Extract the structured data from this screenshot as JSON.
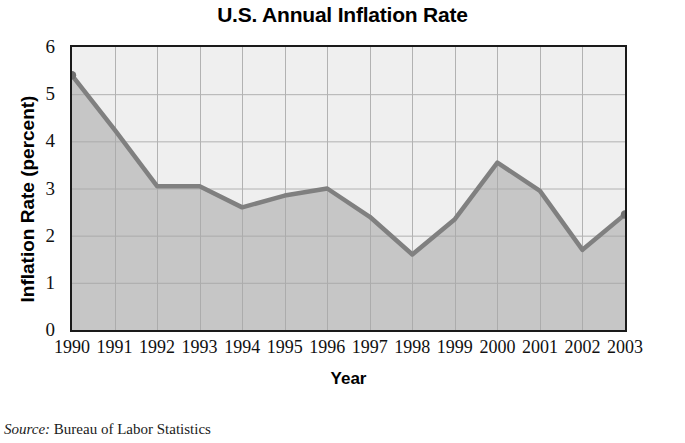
{
  "chart_data": {
    "type": "area",
    "title": "U.S. Annual Inflation Rate",
    "xlabel": "Year",
    "ylabel": "Inflation Rate (percent)",
    "categories": [
      "1990",
      "1991",
      "1992",
      "1993",
      "1994",
      "1995",
      "1996",
      "1997",
      "1998",
      "1999",
      "2000",
      "2001",
      "2002",
      "2003"
    ],
    "values": [
      5.4,
      4.25,
      3.05,
      3.05,
      2.6,
      2.85,
      3.0,
      2.4,
      1.6,
      2.35,
      3.55,
      2.95,
      1.7,
      2.45
    ],
    "series": [
      {
        "name": "U.S. Annual Inflation Rate",
        "values": [
          5.4,
          4.25,
          3.05,
          3.05,
          2.6,
          2.85,
          3.0,
          2.4,
          1.6,
          2.35,
          3.55,
          2.95,
          1.7,
          2.45
        ]
      }
    ],
    "ylim": [
      0,
      6
    ],
    "yticks": [
      0,
      1,
      2,
      3,
      4,
      5,
      6
    ],
    "ytick_labels": [
      "0",
      "1",
      "2",
      "3",
      "4",
      "5",
      "6"
    ],
    "xticks": [
      "1990",
      "1991",
      "1992",
      "1993",
      "1994",
      "1995",
      "1996",
      "1997",
      "1998",
      "1999",
      "2000",
      "2001",
      "2002",
      "2003"
    ],
    "grid": true,
    "legend": false,
    "legend_position": "none",
    "colors": {
      "line": "#808080",
      "fill_below": "#c6c6c6",
      "fill_above": "#efefef",
      "grid": "#a8a8a8",
      "frame": "#1a1a1a",
      "text": "#111111"
    }
  },
  "source": {
    "label": "Source:",
    "text": " Bureau of Labor Statistics"
  }
}
